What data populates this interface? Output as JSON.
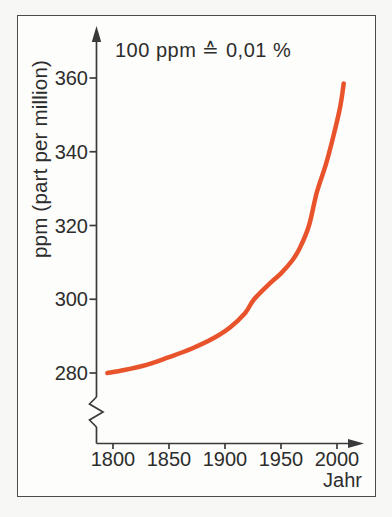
{
  "figure": {
    "kind": "book-style line chart of atmospheric CO2 concentration versus year",
    "annotation": "100 ppm ≙ 0,01 %",
    "y_axis_title": "ppm (part per million)",
    "x_axis_title": "Jahr"
  },
  "colors": {
    "curve": "#e8532c",
    "axis": "#3a3a3a",
    "text": "#2d2d2d",
    "frame_border": "#4a4a4a",
    "panel": "#fdfdfb",
    "page_background": "#f7f7f5"
  },
  "chart_data": {
    "type": "line",
    "title": "",
    "annotation": "100 ppm ≙ 0,01 %",
    "xlabel": "Jahr",
    "ylabel": "ppm (part per million)",
    "x_ticks": [
      "1800",
      "1850",
      "1900",
      "1950",
      "2000"
    ],
    "y_ticks": [
      "280",
      "300",
      "320",
      "340",
      "360"
    ],
    "xlim": [
      1785,
      2012
    ],
    "ylim": [
      280,
      360
    ],
    "axis_break_below_ymin": true,
    "grid": false,
    "legend_position": "none",
    "line_color": "#e8532c",
    "points": [
      {
        "year": 1795,
        "ppm": 280.0
      },
      {
        "year": 1810,
        "ppm": 280.8
      },
      {
        "year": 1830,
        "ppm": 282.2
      },
      {
        "year": 1850,
        "ppm": 284.3
      },
      {
        "year": 1870,
        "ppm": 286.6
      },
      {
        "year": 1890,
        "ppm": 289.5
      },
      {
        "year": 1905,
        "ppm": 292.5
      },
      {
        "year": 1918,
        "ppm": 296.3
      },
      {
        "year": 1926,
        "ppm": 300.0
      },
      {
        "year": 1940,
        "ppm": 304.3
      },
      {
        "year": 1950,
        "ppm": 307.0
      },
      {
        "year": 1960,
        "ppm": 310.5
      },
      {
        "year": 1967,
        "ppm": 314.0
      },
      {
        "year": 1975,
        "ppm": 320.0
      },
      {
        "year": 1982,
        "ppm": 329.0
      },
      {
        "year": 1990,
        "ppm": 336.5
      },
      {
        "year": 1997,
        "ppm": 344.5
      },
      {
        "year": 2003,
        "ppm": 352.5
      },
      {
        "year": 2006,
        "ppm": 358.5
      }
    ]
  }
}
